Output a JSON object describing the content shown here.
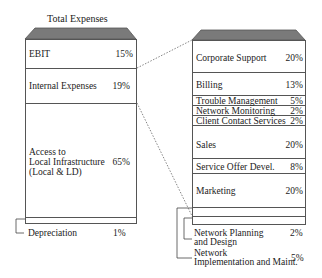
{
  "left_column": {
    "title": "Total Expenses",
    "segments": [
      {
        "label": "EBIT",
        "percent": "15%"
      },
      {
        "label": "Internal Expenses",
        "percent": "19%"
      },
      {
        "label_lines": [
          "Access to",
          "Local Infrastructure",
          "(Local & LD)"
        ],
        "percent": "65%"
      },
      {
        "label": "Depreciation",
        "percent": "1%"
      }
    ]
  },
  "right_column": {
    "segments": [
      {
        "label": "Corporate Support",
        "percent": "20%"
      },
      {
        "label": "Billing",
        "percent": "13%"
      },
      {
        "label": "Trouble Management",
        "percent": "5%"
      },
      {
        "label": "Network Monitoring",
        "percent": "2%"
      },
      {
        "label": "Client Contact Services",
        "percent": "2%"
      },
      {
        "label": "Sales",
        "percent": "20%"
      },
      {
        "label": "Service Offer Devel.",
        "percent": "8%"
      },
      {
        "label": "Marketing",
        "percent": "20%"
      },
      {
        "label_lines": [
          "Network Planning",
          "and Design"
        ],
        "percent": "2%"
      },
      {
        "label_lines": [
          "Network",
          "Implementation and Maint."
        ],
        "percent": "5%"
      }
    ]
  },
  "colors": {
    "cap_fill": "#7a7a7a",
    "border": "#555555",
    "text": "#222222"
  }
}
